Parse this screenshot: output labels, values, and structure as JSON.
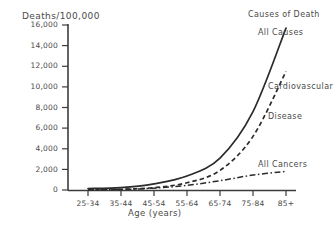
{
  "chart_data": {
    "type": "line",
    "title": "Causes of Death",
    "ylabel": "Deaths/100,000",
    "xlabel": "Age (years)",
    "categories": [
      "25-34",
      "35-44",
      "45-54",
      "55-64",
      "65-74",
      "75-84",
      "85+"
    ],
    "ylim": [
      0,
      16000
    ],
    "xlim_note": "categorical age groups",
    "yticks": [
      0,
      2000,
      4000,
      6000,
      8000,
      10000,
      12000,
      14000,
      16000
    ],
    "ytick_labels": [
      "0",
      "2,000",
      "4,000",
      "6,000",
      "8,000",
      "10,000",
      "12,000",
      "14,000",
      "16,000"
    ],
    "grid": false,
    "legend_position": "inline-annotations",
    "series": [
      {
        "name": "All Causes",
        "style": "solid",
        "color": "#2b2b2b",
        "values": [
          140,
          230,
          600,
          1350,
          3100,
          7600,
          15700
        ]
      },
      {
        "name": "Cardiovascular Disease",
        "style": "dashed",
        "color": "#2b2b2b",
        "values": [
          30,
          70,
          230,
          700,
          1900,
          5200,
          11500
        ]
      },
      {
        "name": "All Cancers",
        "style": "dash-dot",
        "color": "#2b2b2b",
        "values": [
          20,
          55,
          180,
          450,
          900,
          1450,
          1800
        ]
      }
    ],
    "annotations": [
      {
        "text": "All Causes",
        "series": "All Causes"
      },
      {
        "text": "Cardiovascular",
        "series": "Cardiovascular Disease"
      },
      {
        "text": "Disease",
        "series": "Cardiovascular Disease"
      },
      {
        "text": "All Cancers",
        "series": "All Cancers"
      }
    ]
  },
  "axis": {
    "ylabel": "Deaths/100,000",
    "xlabel": "Age (years)",
    "yticks": [
      "16,000",
      "14,000",
      "12,000",
      "10,000",
      "8,000",
      "6,000",
      "4,000",
      "2,000",
      "0"
    ],
    "xticks": [
      "25-34",
      "35-44",
      "45-54",
      "55-64",
      "65-74",
      "75-84",
      "85+"
    ]
  },
  "labels": {
    "title": "Causes of Death",
    "all_causes": "All Causes",
    "cardio_line1": "Cardiovascular",
    "cardio_line2": "Disease",
    "all_cancers": "All Cancers"
  },
  "colors": {
    "ink": "#2b2b2b",
    "text": "#4a4a4a",
    "background": "#ffffff"
  }
}
